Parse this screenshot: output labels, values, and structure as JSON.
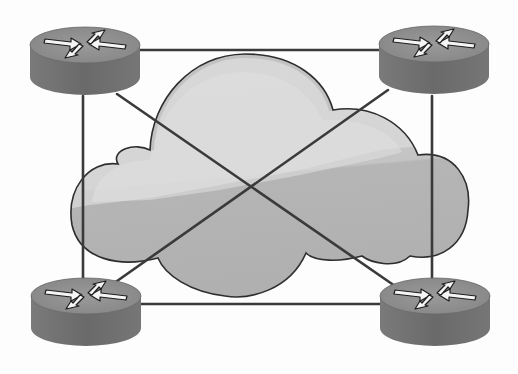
{
  "diagram": {
    "type": "network-topology",
    "description": "Four routers in a full-mesh topology around a central network cloud",
    "topology": "full-mesh",
    "colors": {
      "background": "#fdfdfd",
      "link": "#3a3a3a",
      "cloud_fill_light": "#cfcfcf",
      "cloud_fill_dark": "#b3b3b3",
      "cloud_highlight": "#dedede",
      "cloud_outline": "#2e2e2e",
      "router_top": "#8c8c8c",
      "router_body": "#6e6e6e",
      "router_arrow": "#f4f4f4",
      "router_arrow_shadow": "#1e1e1e"
    },
    "cloud": {
      "name": "network-cloud",
      "icon": "cloud-icon"
    },
    "routers": [
      {
        "id": "router-top-left",
        "icon": "router-icon",
        "cx": 85,
        "cy": 48
      },
      {
        "id": "router-top-right",
        "icon": "router-icon",
        "cx": 434,
        "cy": 48
      },
      {
        "id": "router-bottom-left",
        "icon": "router-icon",
        "cx": 86,
        "cy": 300
      },
      {
        "id": "router-bottom-right",
        "icon": "router-icon",
        "cx": 435,
        "cy": 300
      }
    ],
    "links": [
      {
        "from": "router-top-left",
        "to": "router-top-right"
      },
      {
        "from": "router-bottom-left",
        "to": "router-bottom-right"
      },
      {
        "from": "router-top-left",
        "to": "router-bottom-left"
      },
      {
        "from": "router-top-right",
        "to": "router-bottom-right"
      },
      {
        "from": "router-top-left",
        "to": "router-bottom-right"
      },
      {
        "from": "router-top-right",
        "to": "router-bottom-left"
      }
    ],
    "link_count": 6,
    "router_count": 4
  }
}
